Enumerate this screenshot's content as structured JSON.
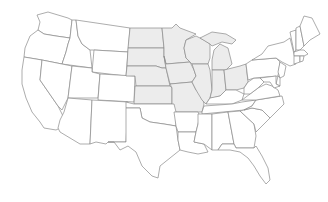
{
  "map": {
    "title": "Contiguous United States — Midwest highlighted",
    "region_highlighted": "Midwest",
    "colors": {
      "highlight_fill": "#ececec",
      "default_fill": "#ffffff",
      "border": "#8a8a8a",
      "background": "#ffffff"
    },
    "highlighted_states": [
      "North Dakota",
      "South Dakota",
      "Nebraska",
      "Kansas",
      "Minnesota",
      "Iowa",
      "Missouri",
      "Wisconsin",
      "Illinois",
      "Michigan",
      "Indiana",
      "Ohio"
    ],
    "states": [
      {
        "code": "WA",
        "name": "Washington",
        "highlighted": false
      },
      {
        "code": "OR",
        "name": "Oregon",
        "highlighted": false
      },
      {
        "code": "CA",
        "name": "California",
        "highlighted": false
      },
      {
        "code": "ID",
        "name": "Idaho",
        "highlighted": false
      },
      {
        "code": "NV",
        "name": "Nevada",
        "highlighted": false
      },
      {
        "code": "MT",
        "name": "Montana",
        "highlighted": false
      },
      {
        "code": "WY",
        "name": "Wyoming",
        "highlighted": false
      },
      {
        "code": "UT",
        "name": "Utah",
        "highlighted": false
      },
      {
        "code": "AZ",
        "name": "Arizona",
        "highlighted": false
      },
      {
        "code": "CO",
        "name": "Colorado",
        "highlighted": false
      },
      {
        "code": "NM",
        "name": "New Mexico",
        "highlighted": false
      },
      {
        "code": "ND",
        "name": "North Dakota",
        "highlighted": true
      },
      {
        "code": "SD",
        "name": "South Dakota",
        "highlighted": true
      },
      {
        "code": "NE",
        "name": "Nebraska",
        "highlighted": true
      },
      {
        "code": "KS",
        "name": "Kansas",
        "highlighted": true
      },
      {
        "code": "OK",
        "name": "Oklahoma",
        "highlighted": false
      },
      {
        "code": "TX",
        "name": "Texas",
        "highlighted": false
      },
      {
        "code": "MN",
        "name": "Minnesota",
        "highlighted": true
      },
      {
        "code": "IA",
        "name": "Iowa",
        "highlighted": true
      },
      {
        "code": "MO",
        "name": "Missouri",
        "highlighted": true
      },
      {
        "code": "AR",
        "name": "Arkansas",
        "highlighted": false
      },
      {
        "code": "LA",
        "name": "Louisiana",
        "highlighted": false
      },
      {
        "code": "WI",
        "name": "Wisconsin",
        "highlighted": true
      },
      {
        "code": "IL",
        "name": "Illinois",
        "highlighted": true
      },
      {
        "code": "MI",
        "name": "Michigan",
        "highlighted": true
      },
      {
        "code": "IN",
        "name": "Indiana",
        "highlighted": true
      },
      {
        "code": "OH",
        "name": "Ohio",
        "highlighted": true
      },
      {
        "code": "KY",
        "name": "Kentucky",
        "highlighted": false
      },
      {
        "code": "TN",
        "name": "Tennessee",
        "highlighted": false
      },
      {
        "code": "MS",
        "name": "Mississippi",
        "highlighted": false
      },
      {
        "code": "AL",
        "name": "Alabama",
        "highlighted": false
      },
      {
        "code": "GA",
        "name": "Georgia",
        "highlighted": false
      },
      {
        "code": "FL",
        "name": "Florida",
        "highlighted": false
      },
      {
        "code": "SC",
        "name": "South Carolina",
        "highlighted": false
      },
      {
        "code": "NC",
        "name": "North Carolina",
        "highlighted": false
      },
      {
        "code": "VA",
        "name": "Virginia",
        "highlighted": false
      },
      {
        "code": "WV",
        "name": "West Virginia",
        "highlighted": false
      },
      {
        "code": "PA",
        "name": "Pennsylvania",
        "highlighted": false
      },
      {
        "code": "NY",
        "name": "New York",
        "highlighted": false
      },
      {
        "code": "NJ",
        "name": "New Jersey",
        "highlighted": false
      },
      {
        "code": "DE",
        "name": "Delaware",
        "highlighted": false
      },
      {
        "code": "MD",
        "name": "Maryland",
        "highlighted": false
      },
      {
        "code": "VT",
        "name": "Vermont",
        "highlighted": false
      },
      {
        "code": "NH",
        "name": "New Hampshire",
        "highlighted": false
      },
      {
        "code": "ME",
        "name": "Maine",
        "highlighted": false
      },
      {
        "code": "MA",
        "name": "Massachusetts",
        "highlighted": false
      },
      {
        "code": "CT",
        "name": "Connecticut",
        "highlighted": false
      },
      {
        "code": "RI",
        "name": "Rhode Island",
        "highlighted": false
      }
    ]
  }
}
